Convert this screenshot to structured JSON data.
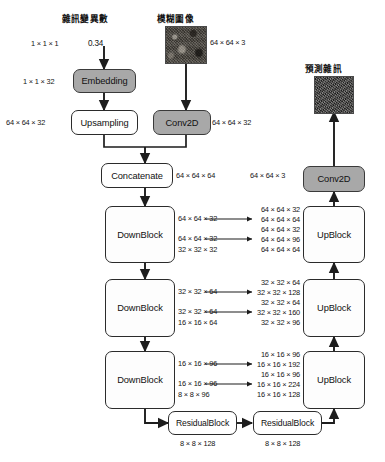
{
  "diagram": {
    "captions": {
      "noise_variance": "雜訊變異數",
      "blurry_image": "模糊圖像",
      "predicted_noise": "預測雜訊"
    },
    "scalar_value": "0.34",
    "nodes": {
      "embedding": "Embedding",
      "upsampling": "Upsampling",
      "conv2d_in": "Conv2D",
      "concatenate": "Concatenate",
      "downblock_1": "DownBlock",
      "downblock_2": "DownBlock",
      "downblock_3": "DownBlock",
      "residualblock_1": "ResidualBlock",
      "residualblock_2": "ResidualBlock",
      "upblock_1": "UpBlock",
      "upblock_2": "UpBlock",
      "upblock_3": "UpBlock",
      "conv2d_out": "Conv2D"
    },
    "shapes": {
      "input_scalar": "1 × 1 × 1",
      "embedding_out": "1 × 1 × 32",
      "upsampling_out": "64 × 64 × 32",
      "image_in": "64 × 64 × 3",
      "conv2d_in_out": "64 × 64 × 32",
      "concatenate_out": "64 × 64 × 64",
      "conv2d_out_in": "64 × 64 × 3",
      "down1_skip_a": "64 × 64 × 32",
      "down1_skip_b": "64 × 64 × 32",
      "down1_out": "32 × 32 × 32",
      "down2_skip_a": "32 × 32 × 64",
      "down2_skip_b": "32 × 32 × 64",
      "down2_out": "16 × 16 × 64",
      "down3_skip_a": "16 × 16 × 96",
      "down3_skip_b": "16 × 16 × 96",
      "down3_out": "8 × 8 × 96",
      "residual1_out": "8 × 8 × 128",
      "residual2_out": "8 × 8 × 128",
      "up1": [
        "64 × 64 × 32",
        "64 × 64 × 64",
        "64 × 64 × 32",
        "64 × 64 × 96",
        "64 × 64 × 64"
      ],
      "up2": [
        "32 × 32 × 64",
        "32 × 32 × 128",
        "32 × 32 × 64",
        "32 × 32 × 160",
        "32 × 32 × 96"
      ],
      "up3": [
        "16 × 16 × 96",
        "16 × 16 × 192",
        "16 × 16 × 96",
        "16 × 16 × 224",
        "16 × 16 × 128"
      ]
    },
    "colors": {
      "shaded_fill": "#a8a8a8",
      "plain_fill": "#ffffff",
      "stroke": "#2b2b2b"
    }
  }
}
